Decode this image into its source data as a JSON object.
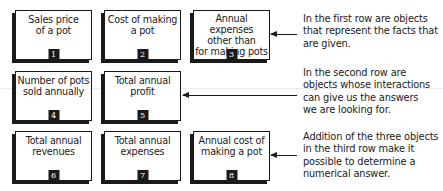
{
  "boxes": [
    {
      "label": "Sales price of a pot",
      "number": "1"
    },
    {
      "label": "Cost of making a pot",
      "number": "2"
    },
    {
      "label": "Annual expenses other than for making pots",
      "number": "3"
    },
    {
      "label": "Number of pots sold annually",
      "number": "4"
    },
    {
      "label": "Total annual profit",
      "number": "5"
    },
    {
      "label": "Total annual revenues",
      "number": "6"
    },
    {
      "label": "Total annual expenses",
      "number": "7"
    },
    {
      "label": "Annual cost of making a pot",
      "number": "8"
    }
  ],
  "labels_lines": {
    "b1": [
      "Sales price",
      "of a pot"
    ],
    "b2": [
      "Cost of making",
      "a pot"
    ],
    "b3": [
      "Annual expenses",
      "other than",
      "for making pots"
    ],
    "b4": [
      "Number of pots",
      "sold annually"
    ],
    "b5": [
      "Total annual",
      "profit"
    ],
    "b6": [
      "Total annual",
      "revenues"
    ],
    "b7": [
      "Total annual",
      "expenses"
    ],
    "b8": [
      "Annual cost of",
      "making a pot"
    ]
  },
  "notes": {
    "row1": [
      "In the first row are objects",
      "that represent the facts that",
      "are given."
    ],
    "row2": [
      "In the second row are",
      "objects whose interactions",
      "can give us the answers",
      "we are looking for."
    ],
    "row3": [
      "Addition of the three objects",
      "in the third row make it",
      "possible to determine a",
      "numerical answer."
    ]
  },
  "colors": {
    "ink": "#1a1a1a",
    "background": "#ffffff"
  }
}
